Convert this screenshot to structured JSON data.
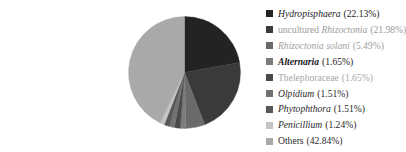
{
  "chart_data": {
    "type": "pie",
    "title": "",
    "start_angle": "top, clockwise",
    "legend_position": "right",
    "slices": [
      {
        "label": "Hydropisphaera",
        "italic": true,
        "value": 22.13,
        "pct_text": "(22.13%)",
        "color": "#232323",
        "text_color": "#1a1a1a"
      },
      {
        "label": "uncultured Rhizoctonia",
        "italic": false,
        "italic_part": "Rhizoctonia",
        "value": 21.98,
        "pct_text": "(21.98%)",
        "color": "#3a3a3a",
        "text_color": "#9a9a9a"
      },
      {
        "label": "Rhizoctonia solani",
        "italic": true,
        "value": 5.49,
        "pct_text": "(5.49%)",
        "color": "#6a6a6a",
        "text_color": "#a0a0a0"
      },
      {
        "label": "Alternaria",
        "italic": true,
        "bold": true,
        "value": 1.65,
        "pct_text": "(1.65%)",
        "color": "#7c7c7c",
        "text_color": "#1a1a1a"
      },
      {
        "label": "Thelephoraceae",
        "italic": false,
        "value": 1.65,
        "pct_text": "(1.65%)",
        "color": "#4a4a4a",
        "text_color": "#a8a8a8"
      },
      {
        "label": "Olpidium",
        "italic": true,
        "value": 1.51,
        "pct_text": "(1.51%)",
        "color": "#727272",
        "text_color": "#2a2a2a"
      },
      {
        "label": "Phytophthora",
        "italic": true,
        "value": 1.51,
        "pct_text": "(1.51%)",
        "color": "#575757",
        "text_color": "#2a2a2a"
      },
      {
        "label": "Penicillium",
        "italic": true,
        "value": 1.24,
        "pct_text": "(1.24%)",
        "color": "#c4c4c4",
        "text_color": "#2a2a2a"
      },
      {
        "label": "Others",
        "italic": false,
        "value": 42.84,
        "pct_text": "(42.84%)",
        "color": "#a9a9a9",
        "text_color": "#2a2a2a"
      }
    ]
  },
  "legend": {
    "items": [
      {
        "name": "Hydropisphaera",
        "pct": "(22.13%)"
      },
      {
        "name": "uncultured Rhizoctonia",
        "pct": "(21.98%)"
      },
      {
        "name": "Rhizoctonia solani",
        "pct": "(5.49%)"
      },
      {
        "name": "Alternaria",
        "pct": "(1.65%)"
      },
      {
        "name": "Thelephoraceae",
        "pct": "(1.65%)"
      },
      {
        "name": "Olpidium",
        "pct": "(1.51%)"
      },
      {
        "name": "Phytophthora",
        "pct": "(1.51%)"
      },
      {
        "name": "Penicillium",
        "pct": "(1.24%)"
      },
      {
        "name": "Others",
        "pct": "(42.84%)"
      }
    ]
  }
}
